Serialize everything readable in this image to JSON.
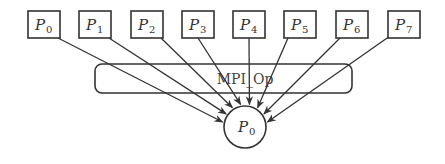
{
  "diagram": {
    "sources": [
      {
        "label": "P",
        "sub": "0",
        "x": 28
      },
      {
        "label": "P",
        "sub": "1",
        "x": 79
      },
      {
        "label": "P",
        "sub": "2",
        "x": 131
      },
      {
        "label": "P",
        "sub": "3",
        "x": 182
      },
      {
        "label": "P",
        "sub": "4",
        "x": 233
      },
      {
        "label": "P",
        "sub": "5",
        "x": 284
      },
      {
        "label": "P",
        "sub": "6",
        "x": 336
      },
      {
        "label": "P",
        "sub": "7",
        "x": 388
      }
    ],
    "operation": {
      "label": "MPI_Op"
    },
    "target": {
      "label": "P",
      "sub": "0"
    },
    "colors": {
      "stroke": "#333333",
      "background": "#ffffff"
    }
  }
}
